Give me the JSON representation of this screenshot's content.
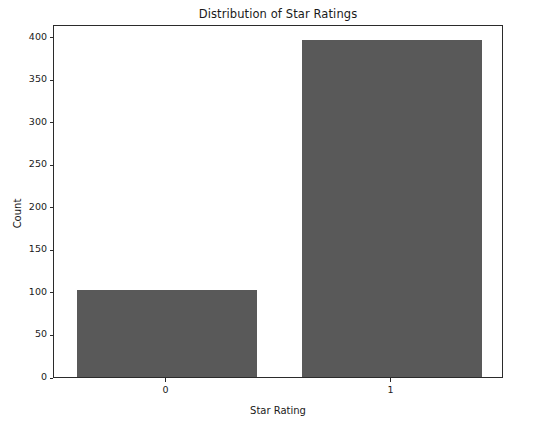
{
  "chart_data": {
    "type": "bar",
    "title": "Distribution of Star Ratings",
    "xlabel": "Star Rating",
    "ylabel": "Count",
    "categories": [
      "0",
      "1"
    ],
    "values": [
      102,
      396
    ],
    "series": [
      {
        "name": "Count",
        "values": [
          102,
          396
        ]
      }
    ],
    "ylim": [
      0,
      415
    ],
    "yticks": [
      0,
      50,
      100,
      150,
      200,
      250,
      300,
      350,
      400
    ],
    "ytick_labels": [
      "0",
      "50",
      "100",
      "150",
      "200",
      "250",
      "300",
      "350",
      "400"
    ],
    "xtick_labels": [
      "0",
      "1"
    ],
    "grid": false,
    "legend": null,
    "bar_color": "#595959",
    "background_color": "#ffffff",
    "axis_color": "#2b2b2b",
    "text_color": "#1a1a1a"
  }
}
